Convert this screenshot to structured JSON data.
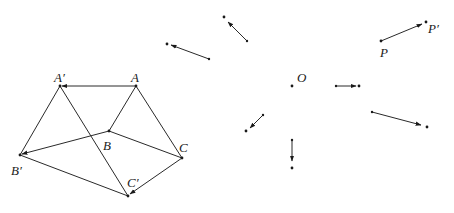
{
  "figure": {
    "type": "translation-diagram",
    "colors": {
      "line": "#2a2a2a",
      "point": "#1a1a1a",
      "background": "#ffffff"
    },
    "labels": {
      "A": "A",
      "A_prime": "A′",
      "B": "B",
      "B_prime": "B′",
      "C": "C",
      "C_prime": "C′",
      "P": "P",
      "P_prime": "P′",
      "O": "O"
    },
    "points": {
      "A": [
        136,
        86
      ],
      "A_prime": [
        60,
        86
      ],
      "B": [
        109,
        131
      ],
      "B_prime": [
        20,
        155
      ],
      "C": [
        182,
        158
      ],
      "C_prime": [
        128,
        196
      ],
      "P": [
        381,
        41
      ],
      "P_prime": [
        426,
        22
      ],
      "O": [
        292,
        86
      ]
    },
    "vectors": [
      {
        "name": "vector-upper-left",
        "from": [
          209,
          59
        ],
        "to": [
          170,
          45
        ],
        "endpoint": [
          167,
          44
        ]
      },
      {
        "name": "vector-upper-middle",
        "from": [
          247,
          41
        ],
        "to": [
          227,
          21
        ],
        "endpoint": [
          224,
          17
        ]
      },
      {
        "name": "vector-P",
        "from": [
          381,
          41
        ],
        "to": [
          422,
          24
        ],
        "endpoint": [
          426,
          22
        ]
      },
      {
        "name": "vector-horizontal",
        "from": [
          336,
          86
        ],
        "to": [
          356,
          86
        ],
        "endpoint": [
          359,
          86
        ]
      },
      {
        "name": "vector-diagonal-small",
        "from": [
          263,
          115
        ],
        "to": [
          249,
          128
        ],
        "endpoint": [
          246,
          131
        ]
      },
      {
        "name": "vector-vertical",
        "from": [
          292,
          140
        ],
        "to": [
          292,
          160
        ],
        "endpoint": [
          292,
          168
        ]
      },
      {
        "name": "vector-right",
        "from": [
          372,
          112
        ],
        "to": [
          421,
          125
        ],
        "endpoint": [
          427,
          127
        ]
      },
      {
        "name": "vector-A",
        "from": [
          136,
          86
        ],
        "to": [
          63,
          86
        ]
      },
      {
        "name": "vector-B",
        "from": [
          109,
          131
        ],
        "to": [
          23,
          154
        ]
      },
      {
        "name": "vector-C",
        "from": [
          182,
          158
        ],
        "to": [
          131,
          193
        ]
      }
    ]
  }
}
